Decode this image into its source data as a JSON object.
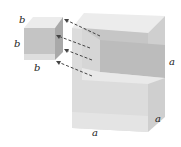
{
  "figure": {
    "small_cube": {
      "labels": {
        "top": "b",
        "left": "b",
        "bottom": "b"
      }
    },
    "large_cube": {
      "labels": {
        "right": "a",
        "depth": "a",
        "bottom": "a"
      }
    },
    "colors": {
      "face_light": "#e6e6e6",
      "face_mid": "#d2d2d2",
      "face_dark": "#bdbdbd",
      "slab": "#c8c8c8",
      "arrow": "#444444"
    }
  }
}
